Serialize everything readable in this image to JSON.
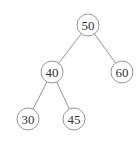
{
  "tree": {
    "nodes": [
      {
        "id": "n50",
        "label": "50",
        "cx": 88,
        "cy": 25
      },
      {
        "id": "n40",
        "label": "40",
        "cx": 52,
        "cy": 72
      },
      {
        "id": "n60",
        "label": "60",
        "cx": 122,
        "cy": 72
      },
      {
        "id": "n30",
        "label": "30",
        "cx": 28,
        "cy": 119
      },
      {
        "id": "n45",
        "label": "45",
        "cx": 74,
        "cy": 119
      }
    ],
    "edges": [
      {
        "from": "n50",
        "to": "n40"
      },
      {
        "from": "n50",
        "to": "n60"
      },
      {
        "from": "n40",
        "to": "n30"
      },
      {
        "from": "n40",
        "to": "n45"
      }
    ],
    "radius": 11
  }
}
